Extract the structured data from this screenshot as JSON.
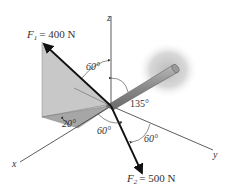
{
  "diagram": {
    "axes": {
      "x": "x",
      "y": "y",
      "z": "z"
    },
    "forces": [
      {
        "name": "F",
        "subscript": "1",
        "value_text": "= 400 N",
        "magnitude": 400,
        "unit": "N"
      },
      {
        "name": "F",
        "subscript": "2",
        "value_text": "= 500 N",
        "magnitude": 500,
        "unit": "N"
      }
    ],
    "angles": {
      "f1_from_z": "60°",
      "f1_base_angle": "20°",
      "f2_from_x": "60°",
      "f2_from_y": "60°",
      "pole_angle": "135°"
    }
  }
}
